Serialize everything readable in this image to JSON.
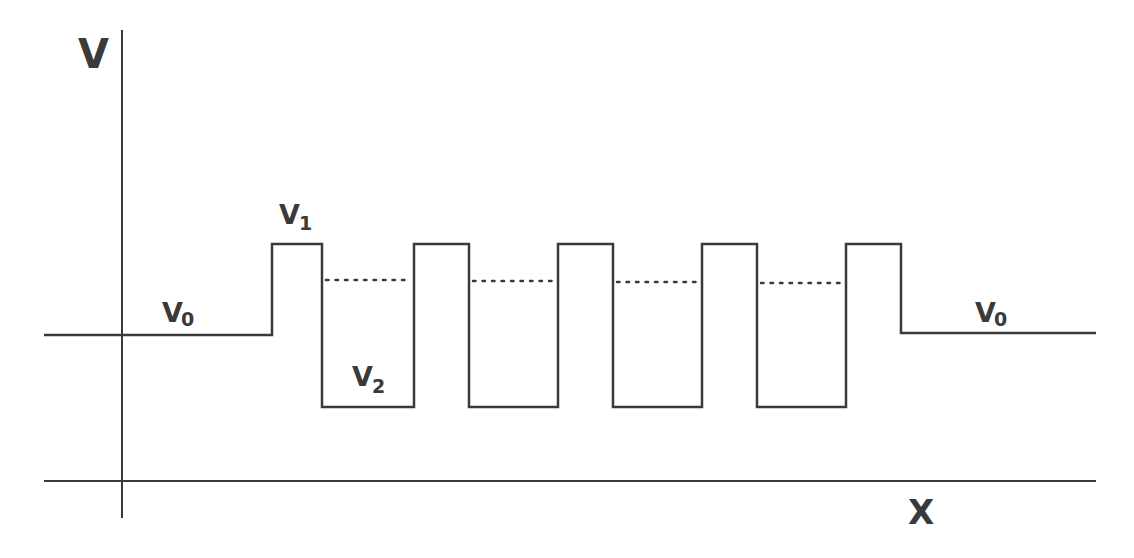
{
  "diagram": {
    "axes": {
      "y_label": "V",
      "x_label": "X"
    },
    "labels": {
      "v0_left": {
        "main": "V",
        "sub": "0"
      },
      "v1": {
        "main": "V",
        "sub": "1"
      },
      "v2": {
        "main": "V",
        "sub": "2"
      },
      "v0_right": {
        "main": "V",
        "sub": "0"
      }
    },
    "levels": {
      "V0_y": 335,
      "V1_y": 244,
      "V2_y": 407,
      "dotted_y": 280,
      "axis_y": 481
    },
    "barriers": [
      {
        "x1": 272,
        "x2": 322
      },
      {
        "x1": 414,
        "x2": 469
      },
      {
        "x1": 558,
        "x2": 613
      },
      {
        "x1": 702,
        "x2": 757
      },
      {
        "x1": 846,
        "x2": 901
      }
    ],
    "colors": {
      "line": "#3a3a3a",
      "background": "#ffffff"
    }
  }
}
